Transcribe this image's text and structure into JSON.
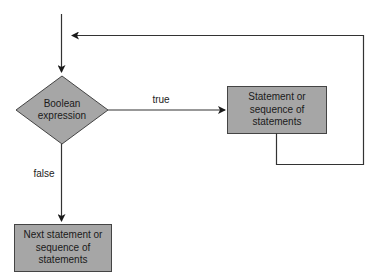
{
  "diagram": {
    "type": "flowchart",
    "title": "",
    "nodes": {
      "condition": {
        "shape": "diamond",
        "lines": [
          "Boolean",
          "expression"
        ]
      },
      "loop_body": {
        "shape": "rectangle",
        "lines": [
          "Statement or",
          "sequence of",
          "statements"
        ]
      },
      "next": {
        "shape": "rectangle",
        "lines": [
          "Next statement or",
          "sequence of",
          "statements"
        ]
      }
    },
    "edges": {
      "true_label": "true",
      "false_label": "false"
    },
    "colors": {
      "node_fill": "#a6a6a6",
      "stroke": "#333333",
      "background": "#ffffff"
    }
  }
}
